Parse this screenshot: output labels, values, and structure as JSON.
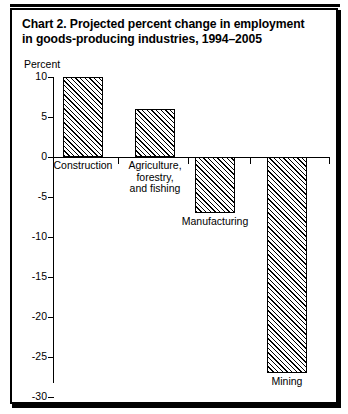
{
  "title": {
    "line1": "Chart 2.  Projected percent change in employment",
    "line2": "in goods-producing industries, 1994–2005"
  },
  "chart_data": {
    "type": "bar",
    "title": "Chart 2.  Projected percent change in employment in goods-producing industries, 1994–2005",
    "xlabel": "",
    "ylabel": "Percent",
    "ylim": [
      -30,
      10
    ],
    "yticks": [
      10,
      5,
      0,
      -5,
      -10,
      -15,
      -20,
      -25,
      -30
    ],
    "ytick_labels": [
      "10",
      "5",
      "0",
      "-5",
      "-10",
      "-15",
      "-20",
      "-25",
      "-30"
    ],
    "grid": false,
    "legend": "none",
    "categories": [
      "Construction",
      "Agriculture, forestry, and fishing",
      "Manufacturing",
      "Mining"
    ],
    "category_label_lines": [
      [
        "Construction"
      ],
      [
        "Agriculture,",
        "forestry,",
        "and fishing"
      ],
      [
        "Manufacturing"
      ],
      [
        "Mining"
      ]
    ],
    "values": [
      10,
      6,
      -7,
      -27
    ],
    "bar_fill": "diagonal-hatch",
    "bar_edge_color": "#000000",
    "background_color": "#ffffff"
  },
  "axis": {
    "unit_label": "Percent"
  }
}
